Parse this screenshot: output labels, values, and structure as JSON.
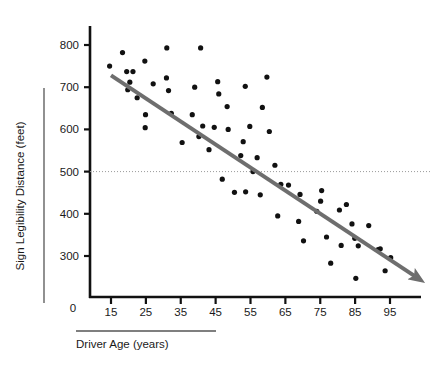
{
  "chart_data": {
    "type": "scatter",
    "title": "",
    "subtitle": "",
    "xlabel": "Driver Age (years)",
    "ylabel": "Sign Legibility Distance (feet)",
    "xlim": [
      11,
      103
    ],
    "ylim": [
      190,
      840
    ],
    "xticks": [
      15,
      25,
      35,
      45,
      55,
      65,
      75,
      85,
      95
    ],
    "xtick_labels": [
      "15",
      "25",
      "35",
      "45",
      "55",
      "65",
      "75",
      "85",
      "95"
    ],
    "yticks": [
      300,
      400,
      500,
      600,
      700,
      800
    ],
    "ytick_labels": [
      "300",
      "400",
      "500",
      "600",
      "700",
      "800"
    ],
    "origin_label": "0",
    "grid": false,
    "legend": null,
    "legend_position": "none",
    "point_color": "#111111",
    "point_radius": 2.6,
    "reference_line": {
      "name": "500-foot reference",
      "orientation": "horizontal",
      "value": 500,
      "style": "dotted",
      "color": "#9a9a9a"
    },
    "trend_line": {
      "name": "regression trend arrow",
      "color": "#6e6e6e",
      "width": 4,
      "arrow": true,
      "x_start": 15,
      "y_start": 728,
      "x_end": 102,
      "y_end": 253
    },
    "series": [
      {
        "name": "Drivers",
        "marker": "circle",
        "points": [
          [
            14.6,
            750
          ],
          [
            18.3,
            782
          ],
          [
            19.5,
            737
          ],
          [
            20.4,
            712
          ],
          [
            21.3,
            737
          ],
          [
            19.8,
            694
          ],
          [
            22.5,
            675
          ],
          [
            24.7,
            762
          ],
          [
            24.9,
            635
          ],
          [
            24.8,
            604
          ],
          [
            27.1,
            708
          ],
          [
            31.0,
            793
          ],
          [
            30.9,
            722
          ],
          [
            31.5,
            692
          ],
          [
            32.3,
            638
          ],
          [
            35.4,
            569
          ],
          [
            38.3,
            635
          ],
          [
            39.0,
            700
          ],
          [
            40.2,
            583
          ],
          [
            40.7,
            793
          ],
          [
            41.3,
            608
          ],
          [
            43.1,
            552
          ],
          [
            44.6,
            605
          ],
          [
            45.6,
            713
          ],
          [
            45.9,
            684
          ],
          [
            46.9,
            482
          ],
          [
            48.3,
            654
          ],
          [
            48.6,
            600
          ],
          [
            50.4,
            451
          ],
          [
            52.2,
            538
          ],
          [
            52.9,
            571
          ],
          [
            53.5,
            702
          ],
          [
            53.6,
            452
          ],
          [
            54.8,
            607
          ],
          [
            55.7,
            500
          ],
          [
            56.9,
            533
          ],
          [
            57.8,
            445
          ],
          [
            58.4,
            652
          ],
          [
            59.7,
            724
          ],
          [
            60.4,
            595
          ],
          [
            62.0,
            515
          ],
          [
            62.8,
            395
          ],
          [
            63.7,
            470
          ],
          [
            65.9,
            468
          ],
          [
            68.8,
            382
          ],
          [
            69.2,
            446
          ],
          [
            70.2,
            336
          ],
          [
            74.0,
            406
          ],
          [
            75.1,
            430
          ],
          [
            75.4,
            455
          ],
          [
            76.8,
            345
          ],
          [
            78.0,
            283
          ],
          [
            80.5,
            409
          ],
          [
            81.0,
            325
          ],
          [
            82.5,
            422
          ],
          [
            84.1,
            376
          ],
          [
            84.9,
            342
          ],
          [
            85.2,
            247
          ],
          [
            85.9,
            324
          ],
          [
            88.9,
            372
          ],
          [
            91.6,
            315
          ],
          [
            92.2,
            317
          ],
          [
            93.6,
            265
          ],
          [
            95.2,
            296
          ]
        ]
      }
    ]
  },
  "labels": {
    "x_axis_title": "Driver Age (years)",
    "y_axis_title": "Sign Legibility Distance (feet)",
    "origin": "0"
  }
}
